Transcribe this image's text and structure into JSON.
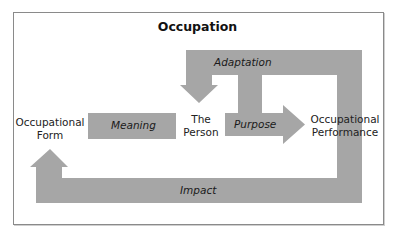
{
  "diagram": {
    "title": "Occupation",
    "colors": {
      "arrow_fill": "#a6a6a6",
      "frame_border": "#8a8a8a",
      "text": "#222222",
      "background": "#ffffff"
    },
    "nodes": {
      "occupational_form": {
        "line1": "Occupational",
        "line2": "Form"
      },
      "the_person": {
        "line1": "The",
        "line2": "Person"
      },
      "occupational_performance": {
        "line1": "Occupational",
        "line2": "Performance"
      }
    },
    "arrows": {
      "meaning": {
        "label": "Meaning",
        "from": "Occupational Form",
        "to": "The Person"
      },
      "purpose": {
        "label": "Purpose",
        "from": "The Person",
        "to": "Occupational Performance"
      },
      "adaptation": {
        "label": "Adaptation",
        "from": "Occupational Performance",
        "to": "The Person"
      },
      "impact": {
        "label": "Impact",
        "from": "Occupational Performance",
        "to": "Occupational Form"
      }
    }
  }
}
